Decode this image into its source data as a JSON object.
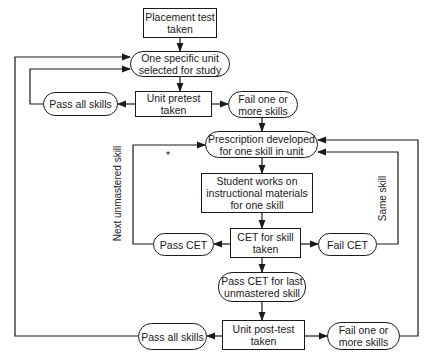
{
  "nodes": {
    "placement_test": "Placement test\ntaken",
    "unit_selected": "One specific unit\nselected for study",
    "unit_pretest": "Unit pretest\ntaken",
    "pretest_pass": "Pass all skills",
    "pretest_fail": "Fail one or\nmore skills",
    "prescription": "Prescription developed\nfor one skill in unit",
    "student_works": "Student works on\ninstructional materials\nfor one skill",
    "cet_taken": "CET for skill\ntaken",
    "pass_cet": "Pass CET",
    "fail_cet": "Fail CET",
    "pass_cet_last": "Pass CET for last\nunmastered skill",
    "unit_posttest": "Unit post-test\ntaken",
    "posttest_pass": "Pass all skills",
    "posttest_fail": "Fail one or\nmore skills"
  },
  "edge_labels": {
    "next_unmastered": "Next unmastered skill",
    "same_skill": "Same skill",
    "asterisk": "*"
  }
}
